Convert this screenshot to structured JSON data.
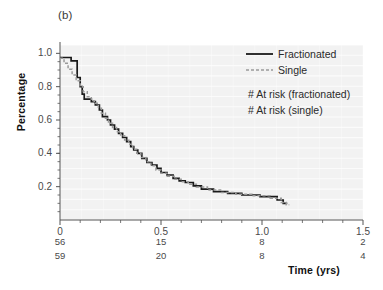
{
  "figure": {
    "panel_label": "(b)",
    "ylabel": "Percentage",
    "xlabel": "Time (yrs)"
  },
  "legend": {
    "entries": [
      {
        "label": "Fractionated",
        "style": "solid",
        "color": "#1a1a1a"
      },
      {
        "label": "Single",
        "style": "dashed",
        "color": "#9a9a9a"
      }
    ],
    "risk_notes": [
      "# At risk (fractionated)",
      "# At risk (single)"
    ]
  },
  "axes": {
    "x_ticks": [
      "0",
      "0.5",
      "1.0",
      "1.5"
    ],
    "y_ticks": [
      "0.2",
      "0.4",
      "0.6",
      "0.8",
      "1.0"
    ]
  },
  "at_risk": {
    "fractionated": [
      "56",
      "15",
      "8",
      "2"
    ],
    "single": [
      "59",
      "20",
      "8",
      "4"
    ]
  },
  "colors": {
    "plot_background": "#f2f2f2",
    "gridline": "#ffffff",
    "fractionated_line": "#1a1a1a",
    "single_line": "#9a9a9a",
    "axis": "#555555"
  },
  "chart_data": {
    "type": "line",
    "title": "(b)",
    "xlabel": "Time (yrs)",
    "ylabel": "Percentage",
    "xlim": [
      0,
      1.5
    ],
    "ylim": [
      0,
      1.05
    ],
    "x_ticks": [
      0,
      0.5,
      1.0,
      1.5
    ],
    "y_ticks": [
      0.2,
      0.4,
      0.6,
      0.8,
      1.0
    ],
    "x_minor_tick_step": 0.1,
    "y_minor_tick_step": 0.05,
    "grid": "horizontal-white-on-gray",
    "legend_position": "upper-right-inside",
    "curve_shape": "step",
    "at_risk_table": {
      "x_positions": [
        0,
        0.5,
        1.0,
        1.5
      ],
      "rows": [
        {
          "name": "# At risk (fractionated)",
          "values": [
            56,
            15,
            8,
            2
          ]
        },
        {
          "name": "# At risk (single)",
          "values": [
            59,
            20,
            8,
            4
          ]
        }
      ]
    },
    "series": [
      {
        "name": "Fractionated",
        "style": "solid",
        "color": "#1a1a1a",
        "points": [
          [
            0.0,
            0.975
          ],
          [
            0.055,
            0.975
          ],
          [
            0.055,
            0.955
          ],
          [
            0.085,
            0.955
          ],
          [
            0.085,
            0.855
          ],
          [
            0.1,
            0.855
          ],
          [
            0.1,
            0.8
          ],
          [
            0.11,
            0.8
          ],
          [
            0.11,
            0.755
          ],
          [
            0.12,
            0.755
          ],
          [
            0.12,
            0.725
          ],
          [
            0.155,
            0.725
          ],
          [
            0.155,
            0.71
          ],
          [
            0.175,
            0.71
          ],
          [
            0.175,
            0.69
          ],
          [
            0.195,
            0.69
          ],
          [
            0.195,
            0.66
          ],
          [
            0.21,
            0.66
          ],
          [
            0.21,
            0.62
          ],
          [
            0.235,
            0.62
          ],
          [
            0.235,
            0.6
          ],
          [
            0.25,
            0.6
          ],
          [
            0.25,
            0.57
          ],
          [
            0.27,
            0.57
          ],
          [
            0.27,
            0.545
          ],
          [
            0.29,
            0.545
          ],
          [
            0.29,
            0.52
          ],
          [
            0.31,
            0.52
          ],
          [
            0.31,
            0.495
          ],
          [
            0.33,
            0.495
          ],
          [
            0.33,
            0.47
          ],
          [
            0.35,
            0.47
          ],
          [
            0.35,
            0.44
          ],
          [
            0.365,
            0.44
          ],
          [
            0.365,
            0.42
          ],
          [
            0.385,
            0.42
          ],
          [
            0.385,
            0.4
          ],
          [
            0.405,
            0.4
          ],
          [
            0.405,
            0.37
          ],
          [
            0.43,
            0.37
          ],
          [
            0.43,
            0.345
          ],
          [
            0.455,
            0.345
          ],
          [
            0.455,
            0.33
          ],
          [
            0.48,
            0.33
          ],
          [
            0.48,
            0.31
          ],
          [
            0.5,
            0.31
          ],
          [
            0.5,
            0.285
          ],
          [
            0.53,
            0.285
          ],
          [
            0.53,
            0.27
          ],
          [
            0.56,
            0.27
          ],
          [
            0.56,
            0.25
          ],
          [
            0.59,
            0.25
          ],
          [
            0.59,
            0.235
          ],
          [
            0.62,
            0.235
          ],
          [
            0.62,
            0.225
          ],
          [
            0.66,
            0.225
          ],
          [
            0.66,
            0.205
          ],
          [
            0.7,
            0.205
          ],
          [
            0.7,
            0.185
          ],
          [
            0.76,
            0.185
          ],
          [
            0.76,
            0.17
          ],
          [
            0.83,
            0.17
          ],
          [
            0.83,
            0.16
          ],
          [
            0.9,
            0.16
          ],
          [
            0.9,
            0.15
          ],
          [
            0.99,
            0.15
          ],
          [
            0.99,
            0.14
          ],
          [
            1.075,
            0.14
          ],
          [
            1.075,
            0.12
          ],
          [
            1.105,
            0.12
          ],
          [
            1.105,
            0.1
          ],
          [
            1.125,
            0.1
          ]
        ]
      },
      {
        "name": "Single",
        "style": "dashed",
        "color": "#9a9a9a",
        "points": [
          [
            0.0,
            0.97
          ],
          [
            0.02,
            0.97
          ],
          [
            0.02,
            0.94
          ],
          [
            0.04,
            0.94
          ],
          [
            0.04,
            0.905
          ],
          [
            0.06,
            0.905
          ],
          [
            0.06,
            0.87
          ],
          [
            0.08,
            0.87
          ],
          [
            0.08,
            0.835
          ],
          [
            0.1,
            0.835
          ],
          [
            0.1,
            0.8
          ],
          [
            0.115,
            0.8
          ],
          [
            0.115,
            0.77
          ],
          [
            0.135,
            0.77
          ],
          [
            0.135,
            0.74
          ],
          [
            0.155,
            0.74
          ],
          [
            0.155,
            0.715
          ],
          [
            0.17,
            0.715
          ],
          [
            0.17,
            0.7
          ],
          [
            0.19,
            0.7
          ],
          [
            0.19,
            0.67
          ],
          [
            0.205,
            0.67
          ],
          [
            0.205,
            0.64
          ],
          [
            0.225,
            0.64
          ],
          [
            0.225,
            0.61
          ],
          [
            0.24,
            0.61
          ],
          [
            0.24,
            0.58
          ],
          [
            0.26,
            0.58
          ],
          [
            0.26,
            0.555
          ],
          [
            0.28,
            0.555
          ],
          [
            0.28,
            0.53
          ],
          [
            0.3,
            0.53
          ],
          [
            0.3,
            0.505
          ],
          [
            0.32,
            0.505
          ],
          [
            0.32,
            0.48
          ],
          [
            0.34,
            0.48
          ],
          [
            0.34,
            0.455
          ],
          [
            0.36,
            0.455
          ],
          [
            0.36,
            0.425
          ],
          [
            0.38,
            0.425
          ],
          [
            0.38,
            0.4
          ],
          [
            0.4,
            0.4
          ],
          [
            0.4,
            0.375
          ],
          [
            0.425,
            0.375
          ],
          [
            0.425,
            0.35
          ],
          [
            0.45,
            0.35
          ],
          [
            0.45,
            0.325
          ],
          [
            0.475,
            0.325
          ],
          [
            0.475,
            0.3
          ],
          [
            0.5,
            0.3
          ],
          [
            0.5,
            0.28
          ],
          [
            0.53,
            0.28
          ],
          [
            0.53,
            0.262
          ],
          [
            0.565,
            0.262
          ],
          [
            0.565,
            0.245
          ],
          [
            0.6,
            0.245
          ],
          [
            0.6,
            0.23
          ],
          [
            0.635,
            0.23
          ],
          [
            0.635,
            0.215
          ],
          [
            0.675,
            0.215
          ],
          [
            0.675,
            0.198
          ],
          [
            0.73,
            0.198
          ],
          [
            0.73,
            0.18
          ],
          [
            0.8,
            0.18
          ],
          [
            0.8,
            0.165
          ],
          [
            0.87,
            0.165
          ],
          [
            0.87,
            0.155
          ],
          [
            0.95,
            0.155
          ],
          [
            0.95,
            0.145
          ],
          [
            1.04,
            0.145
          ],
          [
            1.04,
            0.13
          ],
          [
            1.095,
            0.13
          ],
          [
            1.095,
            0.105
          ],
          [
            1.12,
            0.105
          ],
          [
            1.12,
            0.092
          ],
          [
            1.135,
            0.092
          ]
        ]
      }
    ]
  }
}
